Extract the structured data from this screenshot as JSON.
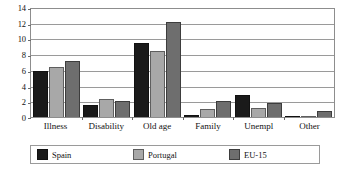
{
  "chart_data": {
    "type": "bar",
    "title": "",
    "subtitle": "",
    "xlabel": "",
    "ylabel": "",
    "ylim": [
      0,
      14
    ],
    "ytick_step": 2,
    "yticks": [
      "0",
      "2",
      "4",
      "6",
      "8",
      "10",
      "12",
      "14"
    ],
    "grid": true,
    "grid_axis": "y",
    "legend_position": "bottom",
    "categories": [
      "Illness",
      "Disability",
      "Old age",
      "Family",
      "Unempl",
      "Other"
    ],
    "series": [
      {
        "name": "Spain",
        "color": "#1a1a1a",
        "values": [
          5.9,
          1.5,
          9.4,
          0.3,
          2.8,
          0.1
        ]
      },
      {
        "name": "Portugal",
        "color": "#a8a8a8",
        "values": [
          6.4,
          2.3,
          8.4,
          1.0,
          1.1,
          0.1
        ]
      },
      {
        "name": "EU-15",
        "color": "#6e6e6e",
        "values": [
          7.1,
          2.1,
          12.1,
          2.1,
          1.8,
          0.8
        ]
      }
    ]
  },
  "legend": {
    "items": [
      {
        "label": "Spain"
      },
      {
        "label": "Portugal"
      },
      {
        "label": "EU-15"
      }
    ]
  },
  "colors": {
    "spain": "#1a1a1a",
    "portugal": "#a8a8a8",
    "eu15": "#6e6e6e",
    "gridline": "#9a9a9a",
    "frame": "#8d8d8d",
    "text": "#111111"
  }
}
